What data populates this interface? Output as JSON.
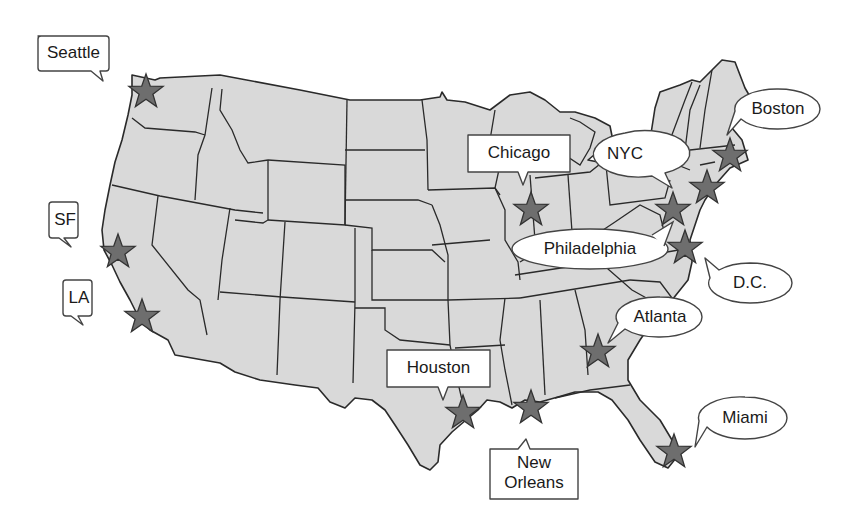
{
  "map": {
    "title": "",
    "land_color": "#d9d9d9",
    "border_color": "#2a2a2a",
    "star_color": "#6e6e6e",
    "background": "#ffffff"
  },
  "cities": [
    {
      "name": "Seattle",
      "label": "Seattle",
      "bubble": "rect",
      "star": [
        146,
        92
      ]
    },
    {
      "name": "SF",
      "label": "SF",
      "bubble": "rect",
      "star": [
        118,
        252
      ]
    },
    {
      "name": "LA",
      "label": "LA",
      "bubble": "rect",
      "star": [
        142,
        317
      ]
    },
    {
      "name": "Chicago",
      "label": "Chicago",
      "bubble": "rect",
      "star": [
        531,
        210
      ]
    },
    {
      "name": "NYC",
      "label": "NYC",
      "bubble": "ellipse",
      "star": [
        707,
        188
      ]
    },
    {
      "name": "Boston",
      "label": "Boston",
      "bubble": "ellipse",
      "star": [
        730,
        156
      ]
    },
    {
      "name": "Philadelphia",
      "label": "Philadelphia",
      "bubble": "ellipse",
      "star": [
        673,
        210
      ]
    },
    {
      "name": "D.C.",
      "label": "D.C.",
      "bubble": "ellipse",
      "star": [
        685,
        248
      ]
    },
    {
      "name": "Atlanta",
      "label": "Atlanta",
      "bubble": "ellipse",
      "star": [
        598,
        352
      ]
    },
    {
      "name": "Houston",
      "label": "Houston",
      "bubble": "rect",
      "star": [
        463,
        413
      ]
    },
    {
      "name": "New Orleans",
      "label_line1": "New",
      "label_line2": "Orleans",
      "bubble": "rect",
      "star": [
        531,
        408
      ]
    },
    {
      "name": "Miami",
      "label": "Miami",
      "bubble": "ellipse",
      "star": [
        674,
        452
      ]
    }
  ]
}
